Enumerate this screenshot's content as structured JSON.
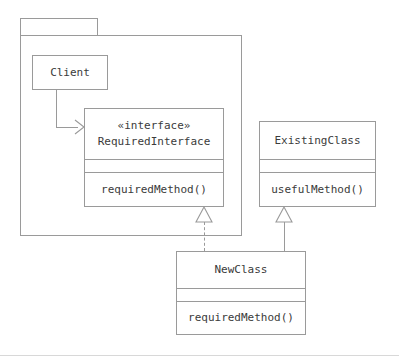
{
  "diagram": {
    "kind": "uml-class-diagram",
    "stroke_color": "#9a9a9a",
    "text_color": "#3b3b3b",
    "background_color": "#ffffff"
  },
  "package": {
    "name": "",
    "tab_label": ""
  },
  "classes": {
    "client": {
      "name": "Client",
      "stereotype": "",
      "attributes": [],
      "operations": []
    },
    "required_interface": {
      "stereotype": "«interface»",
      "name": "RequiredInterface",
      "attributes": [],
      "operations": [
        "requiredMethod()"
      ]
    },
    "existing_class": {
      "stereotype": "",
      "name": "ExistingClass",
      "attributes": [],
      "operations": [
        "usefulMethod()"
      ]
    },
    "new_class": {
      "stereotype": "",
      "name": "NewClass",
      "attributes": [],
      "operations": [
        "requiredMethod()"
      ]
    }
  },
  "relationships": [
    {
      "id": "client-uses-requiredinterface",
      "type": "dependency",
      "line_style": "solid",
      "arrow": "open-arrow",
      "source": "Client",
      "target": "RequiredInterface",
      "label": ""
    },
    {
      "id": "newclass-realizes-requiredinterface",
      "type": "realization",
      "line_style": "dashed",
      "arrow": "hollow-triangle",
      "source": "NewClass",
      "target": "RequiredInterface",
      "label": ""
    },
    {
      "id": "newclass-extends-existingclass",
      "type": "generalization",
      "line_style": "solid",
      "arrow": "hollow-triangle",
      "source": "NewClass",
      "target": "ExistingClass",
      "label": ""
    }
  ]
}
